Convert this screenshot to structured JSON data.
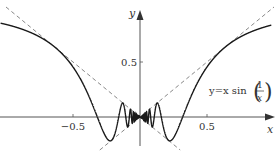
{
  "chart_data": {
    "type": "line",
    "title": "",
    "function_label": {
      "prefix": "y=x sin",
      "numerator": "1",
      "denominator": "x"
    },
    "xlabel": "x",
    "ylabel": "y",
    "xlim": [
      -1.04,
      0.98
    ],
    "ylim": [
      -0.26,
      0.96
    ],
    "x_ticks": [
      {
        "value": -0.5,
        "label": "−0.5"
      },
      {
        "value": 0.5,
        "label": "0.5"
      }
    ],
    "y_ticks": [
      {
        "value": 0.5,
        "label": "0.5"
      }
    ],
    "grid": false,
    "series": [
      {
        "name": "y = x sin(1/x)",
        "style": "solid",
        "expression": "x*sin(1/x)",
        "domain": [
          -1.04,
          0.98
        ]
      },
      {
        "name": "y = x",
        "style": "dashed",
        "expression": "x",
        "domain": [
          -0.3,
          1.0
        ]
      },
      {
        "name": "y = -x",
        "style": "dashed",
        "expression": "-x",
        "domain": [
          -1.0,
          0.3
        ]
      }
    ],
    "colors": {
      "curve": "#1a1a1a",
      "dashed": "#888888",
      "axis": "#555555"
    }
  }
}
